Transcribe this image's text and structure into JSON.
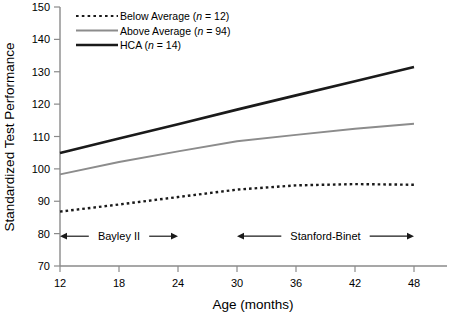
{
  "chart_data": {
    "type": "line",
    "title": "",
    "xlabel": "Age (months)",
    "ylabel": "Standardized Test Performance",
    "x": [
      12,
      18,
      24,
      30,
      36,
      42,
      48
    ],
    "xlim": [
      12,
      48
    ],
    "ylim": [
      70,
      150
    ],
    "xticks": [
      12,
      18,
      24,
      30,
      36,
      42,
      48
    ],
    "yticks": [
      70,
      80,
      90,
      100,
      110,
      120,
      130,
      140,
      150
    ],
    "grid": false,
    "legend_position": "top-left",
    "series": [
      {
        "name": "Below Average",
        "label": "Below Average (n = 12)",
        "n": 12,
        "style": "dotted",
        "color": "#1a1a1a",
        "values": [
          86.8,
          89.0,
          91.3,
          93.6,
          94.9,
          95.3,
          95.1
        ]
      },
      {
        "name": "Above Average",
        "label": "Above Average (n = 94)",
        "n": 94,
        "style": "solid",
        "color": "#8c8c8c",
        "values": [
          98.3,
          102.1,
          105.4,
          108.5,
          110.5,
          112.4,
          113.9
        ]
      },
      {
        "name": "HCA",
        "label": "HCA (n = 14)",
        "n": 14,
        "style": "solid-bold",
        "color": "#1a1a1a",
        "values": [
          104.9,
          109.4,
          113.8,
          118.3,
          122.7,
          127.1,
          131.5
        ]
      }
    ],
    "annotations": [
      {
        "name": "bayley-ii",
        "text": "Bayley II",
        "x_start": 12,
        "x_end": 24,
        "y": 79.2
      },
      {
        "name": "stanford-binet",
        "text": "Stanford-Binet",
        "x_start": 30,
        "x_end": 48,
        "y": 79.2
      }
    ]
  },
  "legend": {
    "items": [
      {
        "prefix": "Below Average (",
        "italic": "n",
        "suffix": " = 12)"
      },
      {
        "prefix": "Above Average (",
        "italic": "n",
        "suffix": " = 94)"
      },
      {
        "prefix": "HCA (",
        "italic": "n",
        "suffix": " = 14)"
      }
    ]
  },
  "axes": {
    "y_title": "Standardized Test Performance",
    "x_title": "Age (months)",
    "y_ticks": [
      "150",
      "140",
      "130",
      "120",
      "110",
      "100",
      "90",
      "80",
      "70"
    ],
    "x_ticks": [
      "12",
      "18",
      "24",
      "30",
      "36",
      "42",
      "48"
    ]
  },
  "annotations": {
    "bayley": "Bayley II",
    "stanford": "Stanford-Binet"
  },
  "colors": {
    "axis": "#8a8a8a",
    "dark_line": "#1a1a1a",
    "gray_line": "#8c8c8c",
    "text": "#000000",
    "background": "#ffffff"
  }
}
